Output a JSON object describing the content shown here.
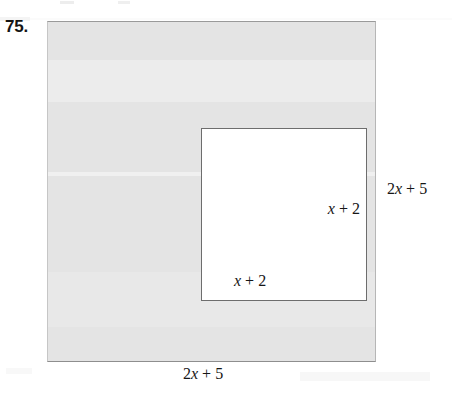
{
  "figure": {
    "problem_number": "75.",
    "colors": {
      "outer_fill": "#e4e4e4",
      "inner_fill": "#ffffff",
      "outer_border": "#9a9a9a",
      "inner_border": "#6d6d6d",
      "text": "#161616",
      "page_background": "#ffffff"
    },
    "labels": {
      "outer_right": {
        "coefficient": "2",
        "variable": "x",
        "operator": "+",
        "constant": "5",
        "text": "2x + 5"
      },
      "outer_bottom": {
        "coefficient": "2",
        "variable": "x",
        "operator": "+",
        "constant": "5",
        "text": "2x + 5"
      },
      "inner_right": {
        "variable": "x",
        "operator": "+",
        "constant": "2",
        "text": "x + 2"
      },
      "inner_bottom": {
        "variable": "x",
        "operator": "+",
        "constant": "2",
        "text": "x + 2"
      }
    }
  }
}
